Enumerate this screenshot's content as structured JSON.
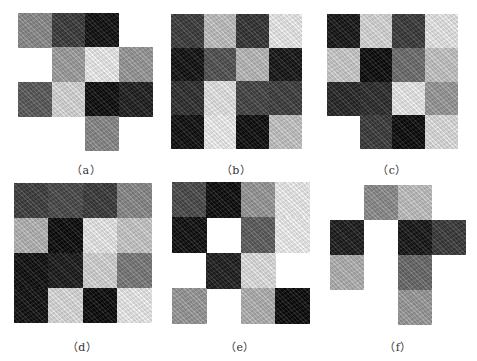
{
  "figure": {
    "panels": [
      {
        "id": "a",
        "label": "（a）",
        "box": {
          "x": 18,
          "y": 13,
          "w": 134,
          "h": 137
        },
        "label_pos": {
          "x": 86,
          "y": 168
        },
        "cells": [
          [
            "#8c8c8c",
            "#3a3a3a",
            "#0f0f0f",
            null
          ],
          [
            null,
            "#a0a0a0",
            "#f2f2f2",
            "#9a9a9a"
          ],
          [
            "#5a5a5a",
            "#dcdcdc",
            "#0c0c0c",
            "#1e1e1e"
          ],
          [
            null,
            null,
            "#8a8a8a",
            null
          ]
        ]
      },
      {
        "id": "b",
        "label": "（b）",
        "box": {
          "x": 171,
          "y": 14,
          "w": 130,
          "h": 134
        },
        "label_pos": {
          "x": 236,
          "y": 168
        },
        "cells": [
          [
            "#3c3c3c",
            "#c4c4c4",
            "#333333",
            "#f0f0f0"
          ],
          [
            "#101010",
            "#525252",
            "#bdbdbd",
            "#141414"
          ],
          [
            "#2e2e2e",
            "#eaeaea",
            "#444444",
            "#3e3e3e"
          ],
          [
            "#0e0e0e",
            "#f4f4f4",
            "#0c0c0c",
            "#c8c8c8"
          ]
        ]
      },
      {
        "id": "c",
        "label": "（c）",
        "box": {
          "x": 327,
          "y": 14,
          "w": 130,
          "h": 135
        },
        "label_pos": {
          "x": 392,
          "y": 168
        },
        "cells": [
          [
            "#151515",
            "#dcdcdc",
            "#3a3a3a",
            "#ececec"
          ],
          [
            "#cfcfcf",
            "#0a0a0a",
            "#6e6e6e",
            "#c8c8c8"
          ],
          [
            "#262626",
            "#2c2c2c",
            "#efefef",
            "#9a9a9a"
          ],
          [
            null,
            "#3a3a3a",
            "#0a0a0a",
            "#e2e2e2"
          ]
        ]
      },
      {
        "id": "d",
        "label": "（d）",
        "box": {
          "x": 14,
          "y": 183,
          "w": 137,
          "h": 140
        },
        "label_pos": {
          "x": 82,
          "y": 345
        },
        "cells": [
          [
            "#3e3e3e",
            "#4a4a4a",
            "#3a3a3a",
            "#8a8a8a"
          ],
          [
            "#b8b8b8",
            "#0a0a0a",
            "#eeeeee",
            "#cccccc"
          ],
          [
            "#0e0e0e",
            "#1a1a1a",
            "#d8d8d8",
            "#7a7a7a"
          ],
          [
            "#101010",
            "#e0e0e0",
            "#0a0a0a",
            "#f0f0f0"
          ]
        ]
      },
      {
        "id": "e",
        "label": "（e）",
        "box": {
          "x": 172,
          "y": 182,
          "w": 137,
          "h": 141
        },
        "label_pos": {
          "x": 240,
          "y": 345
        },
        "cells": [
          [
            "#4a4a4a",
            "#0c0c0c",
            "#9a9a9a",
            "#f2f2f2"
          ],
          [
            "#0e0e0e",
            null,
            "#5e5e5e",
            "#f4f4f4"
          ],
          [
            null,
            "#1e1e1e",
            "#e4e4e4",
            null
          ],
          [
            "#9a9a9a",
            null,
            "#b4b4b4",
            "#0a0a0a"
          ]
        ]
      },
      {
        "id": "f",
        "label": "（f）",
        "box": {
          "x": 330,
          "y": 185,
          "w": 136,
          "h": 140
        },
        "label_pos": {
          "x": 398,
          "y": 345
        },
        "cells": [
          [
            null,
            "#8e8e8e",
            "#c4c4c4",
            null
          ],
          [
            "#1c1c1c",
            null,
            "#151515",
            "#3a3a3a"
          ],
          [
            "#b4b4b4",
            null,
            "#6a6a6a",
            null
          ],
          [
            null,
            null,
            "#9c9c9c",
            null
          ]
        ]
      }
    ]
  }
}
